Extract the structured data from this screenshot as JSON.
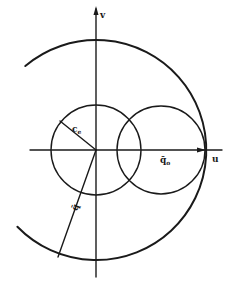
{
  "figure": {
    "labels": {
      "v_axis": "v",
      "u_axis": "u",
      "inner_radius": "c",
      "inner_radius_sub": "e",
      "vector_q0": "q̄",
      "vector_q0_sub": "o",
      "vector_q": "q̄"
    }
  }
}
